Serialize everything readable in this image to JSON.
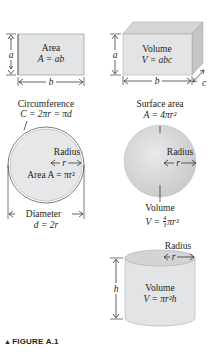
{
  "figure": {
    "caption_marker": "▲",
    "caption": "FIGURE A.1"
  },
  "rectangle": {
    "title": "Area",
    "formula": "A = ab",
    "side_a": "a",
    "side_b": "b"
  },
  "box": {
    "title": "Volume",
    "formula": "V = abc",
    "side_a": "a",
    "side_b": "b",
    "side_c": "c"
  },
  "circle": {
    "circumference_label": "Circumference",
    "circumference_formula": "C = 2πr = πd",
    "radius_label": "Radius",
    "radius_symbol": "r",
    "area_formula": "Area A = πr²",
    "diameter_label": "Diameter",
    "diameter_formula": "d = 2r"
  },
  "sphere": {
    "surface_label": "Surface area",
    "surface_formula": "A = 4πr²",
    "radius_label": "Radius",
    "radius_symbol": "r",
    "volume_label": "Volume",
    "volume_formula_prefix": "V = ",
    "volume_frac_num": "4",
    "volume_frac_den": "3",
    "volume_formula_suffix": "πr³"
  },
  "cylinder": {
    "radius_label": "Radius",
    "radius_symbol": "r",
    "height_symbol": "h",
    "title": "Volume",
    "formula": "V = πr²h"
  },
  "colors": {
    "shape_fill": "#e3e4e6",
    "shape_shade": "#c9cacc",
    "stroke": "#6d6e70",
    "text": "#231f20"
  }
}
